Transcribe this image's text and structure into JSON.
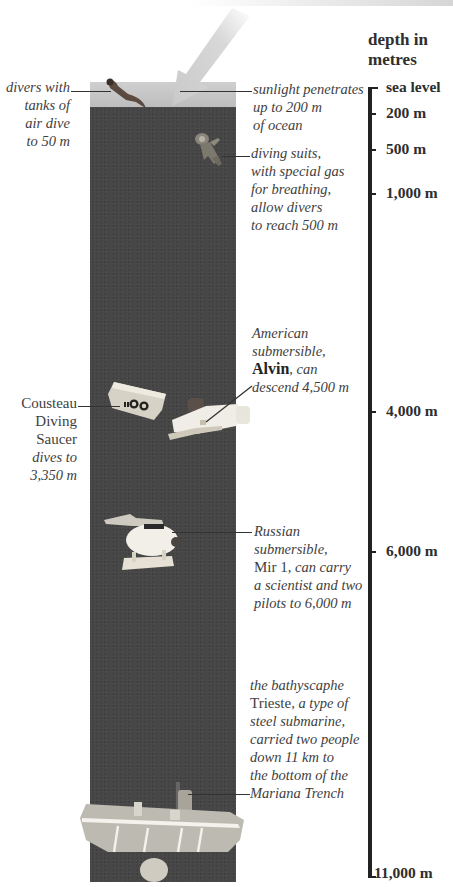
{
  "scale": {
    "title_line1": "depth in",
    "title_line2": "metres",
    "ticks": [
      {
        "label": "sea level",
        "depth_m": 0
      },
      {
        "label": "200 m",
        "depth_m": 200
      },
      {
        "label": "500 m",
        "depth_m": 500
      },
      {
        "label": "1,000 m",
        "depth_m": 1000
      },
      {
        "label": "4,000 m",
        "depth_m": 4000
      },
      {
        "label": "6,000 m",
        "depth_m": 6000
      },
      {
        "label": "11,000 m",
        "depth_m": 11000
      }
    ]
  },
  "annotations": {
    "scuba": {
      "lines": [
        "divers with",
        "tanks of",
        "air dive",
        "to 50 m"
      ],
      "depth_m": 50
    },
    "sunlight": {
      "lines": [
        "sunlight penetrates",
        "up to 200 m",
        "of ocean"
      ],
      "depth_m": 200
    },
    "diving_suits": {
      "lines": [
        "diving suits,",
        "with special gas",
        "for breathing,",
        "allow divers",
        "to reach 500 m"
      ],
      "depth_m": 500
    },
    "alvin": {
      "line1": "American",
      "line2": "submersible,",
      "name": "Alvin",
      "line3_rest": ", can",
      "line4": "descend 4,500 m",
      "depth_m": 4500
    },
    "cousteau": {
      "name_lines": [
        "Cousteau",
        "Diving",
        "Saucer"
      ],
      "italic_lines": [
        "dives to",
        "3,350 m"
      ],
      "depth_m": 3350
    },
    "mir": {
      "line1": "Russian",
      "line2": "submersible,",
      "name": "Mir 1",
      "line3_rest": ", can carry",
      "line4": "a scientist and two",
      "line5": "pilots to 6,000 m",
      "depth_m": 6000
    },
    "trieste": {
      "line1": "the bathyscaphe",
      "name": "Trieste",
      "line2_rest": ", a type of",
      "line3": "steel submarine,",
      "line4": "carried two people",
      "line5": "down 11 km to",
      "line6": "the bottom of the",
      "line7": "Mariana Trench",
      "depth_m": 11000
    }
  },
  "colors": {
    "ocean": "#474747",
    "surface": "#c8c8c8",
    "sunbeam": "#d9d9d9",
    "axis": "#222222",
    "text": "#3e3e3e"
  }
}
